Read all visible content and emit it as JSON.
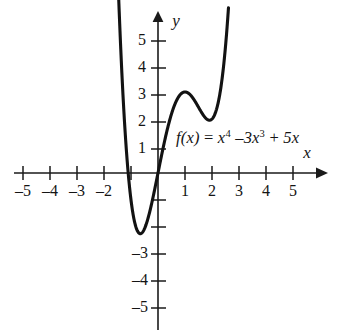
{
  "figure": {
    "name": "polynomial-function-graph",
    "background_color": "#ffffff",
    "ink_color": "#141414"
  },
  "equation": {
    "fx": "f(x)",
    "equals": " = ",
    "term1_base": "x",
    "term1_exp": "4",
    "op1": " –",
    "term2_coef": "3x",
    "term2_exp": "3",
    "op2": " + ",
    "term3": "5x",
    "plain": "f(x) = x4 –3x3 + 5x"
  },
  "axes": {
    "x_label": "x",
    "y_label": "y",
    "x_tick_labels": [
      "–5",
      "–4",
      "–3",
      "–2",
      "1",
      "2",
      "3",
      "4",
      "5"
    ],
    "x_tick_values": [
      -5,
      -4,
      -3,
      -2,
      1,
      2,
      3,
      4,
      5
    ],
    "y_tick_labels": [
      "5",
      "4",
      "3",
      "2",
      "1",
      "–3",
      "–4",
      "–5"
    ],
    "y_tick_values": [
      5,
      4,
      3,
      2,
      1,
      -3,
      -4,
      -5
    ],
    "x_range": [
      -5.5,
      5.6
    ],
    "y_range": [
      -5.6,
      5.6
    ]
  },
  "chart_data": {
    "type": "line",
    "title": "",
    "subtitle": "",
    "xlabel": "x",
    "ylabel": "y",
    "xlim": [
      -5.5,
      5.6
    ],
    "ylim": [
      -5.6,
      5.6
    ],
    "grid": false,
    "legend": null,
    "annotations": [
      {
        "text": "f(x) = x4 –3x3 + 5x",
        "x": 0.7,
        "y": 1.0
      }
    ],
    "xticks": [
      -5,
      -4,
      -3,
      -2,
      -1,
      0,
      1,
      2,
      3,
      4,
      5
    ],
    "xticklabels": [
      "–5",
      "–4",
      "–3",
      "–2",
      "",
      "",
      "1",
      "2",
      "3",
      "4",
      "5"
    ],
    "yticks": [
      -5,
      -4,
      -3,
      -2,
      -1,
      1,
      2,
      3,
      4,
      5
    ],
    "yticklabels": [
      "–5",
      "–4",
      "–3",
      "",
      "",
      "1",
      "2",
      "3",
      "4",
      "5"
    ],
    "series": [
      {
        "name": "f(x) = x^4 - 3x^3 + 5x",
        "formula_coefficients": {
          "x4": 1,
          "x3": -3,
          "x2": 0,
          "x1": 5,
          "x0": 0
        },
        "x_domain_drawn": [
          -1.62,
          2.61
        ],
        "x": [
          -1.62,
          -1.5,
          -1.4,
          -1.3,
          -1.2,
          -1.1,
          -1.0,
          -0.9,
          -0.8,
          -0.7,
          -0.6,
          -0.5,
          -0.4,
          -0.3,
          -0.2,
          -0.1,
          0.0,
          0.1,
          0.2,
          0.3,
          0.4,
          0.5,
          0.6,
          0.7,
          0.8,
          0.9,
          1.0,
          1.1,
          1.2,
          1.3,
          1.4,
          1.5,
          1.6,
          1.7,
          1.8,
          1.9,
          2.0,
          2.1,
          2.2,
          2.3,
          2.4,
          2.5,
          2.6
        ],
        "y": [
          5.19,
          3.19,
          2.13,
          1.23,
          0.48,
          -0.12,
          -0.6,
          -0.97,
          -1.25,
          -1.43,
          -1.48,
          -1.44,
          -1.29,
          -1.06,
          -0.75,
          -0.4,
          0.0,
          0.5,
          0.98,
          1.43,
          1.83,
          2.19,
          2.49,
          2.73,
          2.9,
          2.98,
          3.0,
          2.94,
          2.82,
          2.65,
          2.44,
          2.19,
          1.94,
          1.71,
          1.49,
          1.33,
          2.0,
          1.2,
          1.27,
          1.49,
          1.9,
          2.5,
          3.33
        ],
        "y_exact_note": "y = x^4 - 3x^3 + 5x",
        "features": {
          "root_left": -1.18,
          "root_origin": 0,
          "local_min_left": {
            "x": -0.9,
            "y": -2.45
          },
          "local_max": {
            "x": 1.0,
            "y": 3.0
          },
          "local_min_right": {
            "x": 2.05,
            "y": 2.0
          }
        }
      }
    ]
  }
}
